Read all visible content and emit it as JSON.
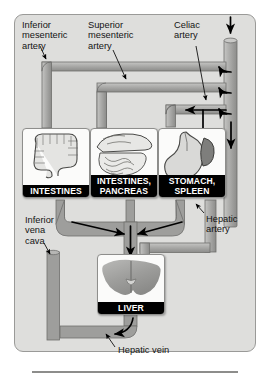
{
  "figure": {
    "background_color": "#dededc",
    "vessel_fill": "#a8a8a6",
    "caption_bg": "#000000",
    "caption_fg": "#ffffff"
  },
  "labels": {
    "inferior_mesenteric_artery": "Inferior\nmesenteric\nartery",
    "superior_mesenteric_artery": "Superior\nmesenteric\nartery",
    "celiac_artery": "Celiac\nartery",
    "hepatic_artery": "Hepatic\nartery",
    "inferior_vena_cava": "Inferior\nvena\ncava",
    "hepatic_vein": "Hepatic vein"
  },
  "organs": [
    {
      "id": "intestines",
      "caption_line1": "INTESTINES",
      "caption_line2": "",
      "art": "large-intestine-icon"
    },
    {
      "id": "intestines-pancreas",
      "caption_line1": "INTESTINES,",
      "caption_line2": "PANCREAS",
      "art": "small-intestine-pancreas-icon"
    },
    {
      "id": "stomach-spleen",
      "caption_line1": "STOMACH,",
      "caption_line2": "SPLEEN",
      "art": "stomach-spleen-icon"
    },
    {
      "id": "liver",
      "caption_line1": "LIVER",
      "caption_line2": "",
      "art": "liver-icon"
    }
  ],
  "flow_arrows": {
    "aorta_inflow": "down",
    "celiac_branch": "left",
    "superior_mesenteric_branch": "left",
    "inferior_mesenteric_branch": "left",
    "portal_confluence": "down",
    "hepatic_vein_outflow": "left"
  }
}
